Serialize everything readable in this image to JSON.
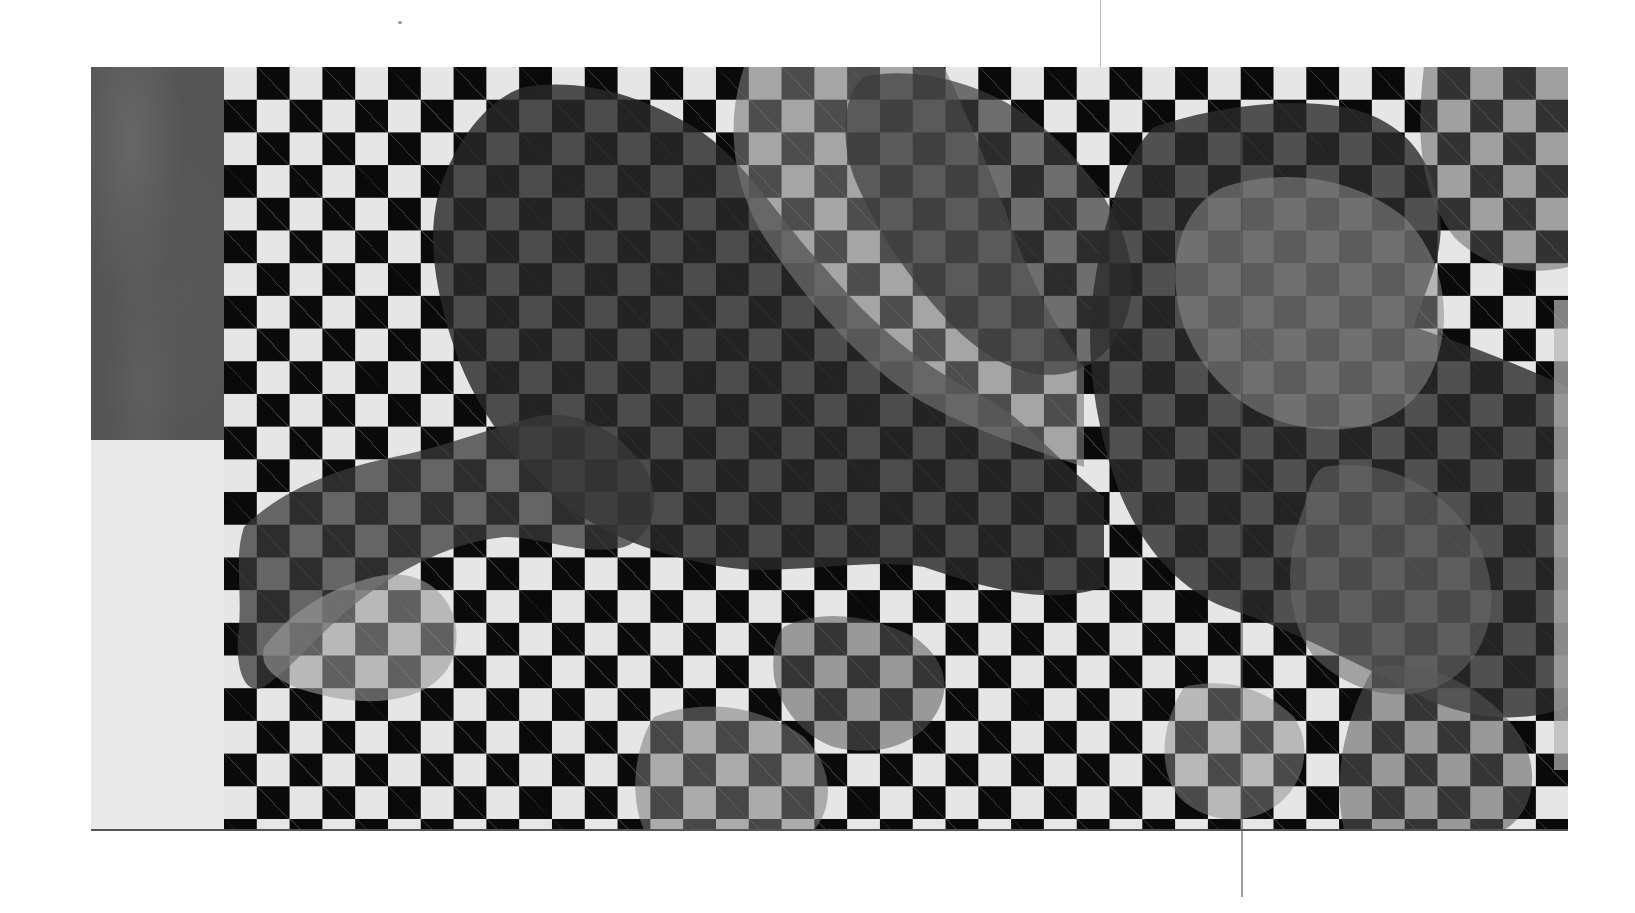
{
  "image": {
    "description": "Grayscale photograph of an artwork: a black-and-white checkerboard with organic gray and dark textured shapes overlaid",
    "board": {
      "columns": 41,
      "rows": 23,
      "dark_color": "#0a0a0a",
      "light_color": "#e6e6e6"
    },
    "side_panels": {
      "top": "dark textured gray",
      "bottom": "light gray"
    },
    "overlay_tones": [
      "#2a2a2a",
      "#5a5a5a",
      "#8a8a8a",
      "#b0b0b0"
    ]
  }
}
